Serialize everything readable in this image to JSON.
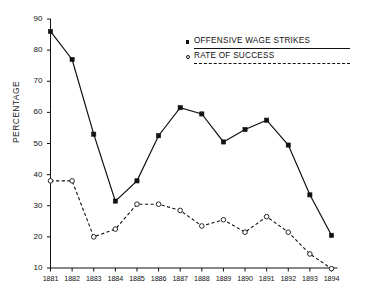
{
  "chart_data": {
    "type": "line",
    "title": "",
    "xlabel": "",
    "ylabel": "PERCENTAGE",
    "categories": [
      "1881",
      "1882",
      "1883",
      "1884",
      "1885",
      "1886",
      "1887",
      "1888",
      "1889",
      "1890",
      "1891",
      "1892",
      "1893",
      "1894"
    ],
    "x_tick_labels": [
      "1881",
      "1882",
      "1883",
      "1884",
      "1885",
      "1886",
      "1887",
      "1888",
      "1889",
      "1890",
      "1891",
      "1892",
      "1893",
      "1894"
    ],
    "y_tick_labels": [
      "90",
      "80",
      "70",
      "60",
      "50",
      "40",
      "30",
      "20",
      "10"
    ],
    "y_ticks": [
      90,
      80,
      70,
      60,
      50,
      40,
      30,
      20,
      10
    ],
    "ylim": [
      10,
      90
    ],
    "grid": false,
    "legend_position": "top-right",
    "series": [
      {
        "name": "OFFENSIVE WAGE STRIKES",
        "marker": "filled-square",
        "line_style": "solid",
        "color": "#111111",
        "values": [
          86,
          77,
          53,
          31.5,
          38,
          52.5,
          61.5,
          59.5,
          50.5,
          54.5,
          57.5,
          49.5,
          33.5,
          20.5
        ]
      },
      {
        "name": "RATE OF SUCCESS",
        "marker": "open-circle",
        "line_style": "dashed",
        "color": "#111111",
        "values": [
          38,
          38,
          20,
          22.5,
          30.5,
          30.5,
          28.5,
          23.5,
          25.5,
          21.5,
          26.5,
          21.5,
          14.5,
          9.8
        ]
      }
    ]
  },
  "legend": {
    "items": [
      {
        "label": "OFFENSIVE WAGE STRIKES",
        "marker": "filled-square",
        "rule": "solid"
      },
      {
        "label": "RATE OF SUCCESS",
        "marker": "open-circle",
        "rule": "dashed"
      }
    ]
  },
  "axis": {
    "y_title": "PERCENTAGE"
  },
  "colors": {
    "ink": "#111111",
    "background": "#ffffff"
  }
}
